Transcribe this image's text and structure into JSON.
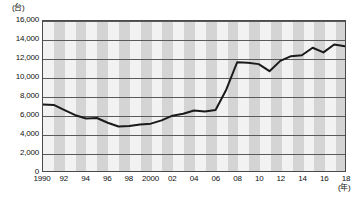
{
  "chart_data": {
    "type": "line",
    "title": "",
    "subtitle": "",
    "xlabel": "(年)",
    "ylabel": "(台)",
    "ylim": [
      0,
      16000
    ],
    "xlim": [
      1990,
      2018
    ],
    "grid": true,
    "legend": false,
    "legend_position": "none",
    "y_ticks": [
      "0",
      "2,000",
      "4,000",
      "6,000",
      "8,000",
      "10,000",
      "12,000",
      "14,000",
      "16,000"
    ],
    "y_tick_values": [
      0,
      2000,
      4000,
      6000,
      8000,
      10000,
      12000,
      14000,
      16000
    ],
    "x_tick_labels": [
      "1990",
      "92",
      "94",
      "96",
      "98",
      "2000",
      "02",
      "04",
      "06",
      "08",
      "10",
      "12",
      "14",
      "16",
      "18"
    ],
    "x_tick_values": [
      1990,
      1992,
      1994,
      1996,
      1998,
      2000,
      2002,
      2004,
      2006,
      2008,
      2010,
      2012,
      2014,
      2016,
      2018
    ],
    "x": [
      1990,
      1991,
      1992,
      1993,
      1994,
      1995,
      1996,
      1997,
      1998,
      1999,
      2000,
      2001,
      2002,
      2003,
      2004,
      2005,
      2006,
      2007,
      2008,
      2009,
      2010,
      2011,
      2012,
      2013,
      2014,
      2015,
      2016,
      2017,
      2018
    ],
    "values": [
      7100,
      7050,
      6500,
      5950,
      5600,
      5650,
      5150,
      4750,
      4800,
      4950,
      5050,
      5400,
      5900,
      6100,
      6450,
      6350,
      6500,
      8700,
      11600,
      11550,
      11400,
      10650,
      11750,
      12250,
      12350,
      13150,
      12650,
      13500,
      13300
    ],
    "series": [
      {
        "name": "",
        "color": "#1a1a1a",
        "values": [
          7100,
          7050,
          6500,
          5950,
          5600,
          5650,
          5150,
          4750,
          4800,
          4950,
          5050,
          5400,
          5900,
          6100,
          6450,
          6350,
          6500,
          8700,
          11600,
          11550,
          11400,
          10650,
          11750,
          12250,
          12350,
          13150,
          12650,
          13500,
          13300
        ]
      }
    ],
    "annotations": [],
    "colors": {
      "line": "#1a1a1a",
      "grid": "#5a5a5a",
      "band_light": "#f2f2f2",
      "band_dark": "#d4d4d4",
      "frame": "#4a4a4a",
      "text": "#111111"
    }
  }
}
